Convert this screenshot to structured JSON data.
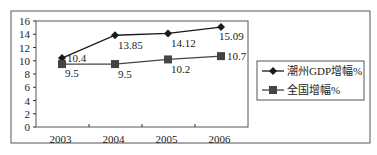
{
  "chart_data": {
    "type": "line",
    "title": "",
    "xlabel": "",
    "ylabel": "",
    "categories": [
      "2003",
      "2004",
      "2005",
      "2006"
    ],
    "ylim": [
      0,
      16
    ],
    "yticks": [
      "0",
      "2",
      "4",
      "6",
      "8",
      "10",
      "12",
      "14",
      "16"
    ],
    "ytick_values": [
      0,
      2,
      4,
      6,
      8,
      10,
      12,
      14,
      16
    ],
    "grid": false,
    "legend_position": "right",
    "series": [
      {
        "name": "潮州GDP增幅%",
        "marker": "diamond",
        "color": "#1a1a1a",
        "values": [
          10.4,
          13.85,
          14.12,
          15.09
        ],
        "labels": [
          "10.4",
          "13.85",
          "14.12",
          "15.09"
        ]
      },
      {
        "name": "全国增幅%",
        "marker": "square",
        "color": "#444444",
        "values": [
          9.5,
          9.5,
          10.2,
          10.7
        ],
        "labels": [
          "9.5",
          "9.5",
          "10.2",
          "10.7"
        ]
      }
    ]
  }
}
